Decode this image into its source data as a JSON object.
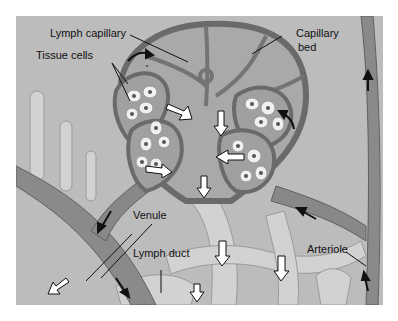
{
  "figure": {
    "labels": {
      "lymph_capillary": "Lymph capillary",
      "tissue_cells": "Tissue cells",
      "capillary_bed": "Capillary",
      "capillary_bed_line2": "bed",
      "venule": "Venule",
      "lymph_duct": "Lymph duct",
      "arteriole": "Arteriole"
    },
    "colors": {
      "background": "#b9b9b9",
      "vessel": "#7a7a7a",
      "vessel_dark": "#5a5a5a",
      "lymph": "#d6d6d6",
      "cell": "#f2f2f2",
      "nucleus": "#555555",
      "arrow": "#111111"
    }
  }
}
